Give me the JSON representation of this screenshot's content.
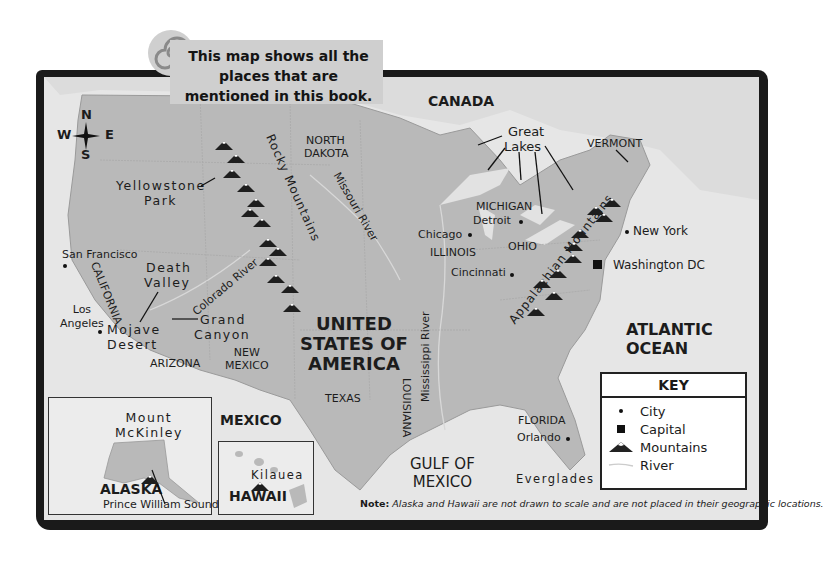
{
  "banner": {
    "text": "This map shows all the places that are mentioned in this book.",
    "icon": "spiral-icon"
  },
  "compass": {
    "n": "N",
    "s": "S",
    "e": "E",
    "w": "W"
  },
  "countries": {
    "canada": "CANADA",
    "mexico": "MEXICO",
    "usa": [
      "UNITED",
      "STATES OF",
      "AMERICA"
    ]
  },
  "water": {
    "atlantic": [
      "ATLANTIC",
      "OCEAN"
    ],
    "gulf": [
      "GULF OF",
      "MEXICO"
    ],
    "great_lakes": [
      "Great",
      "Lakes"
    ],
    "rivers": {
      "missouri": "Missouri River",
      "colorado": "Colorado River",
      "mississippi": "Mississippi River"
    }
  },
  "states": {
    "north_dakota": [
      "NORTH",
      "DAKOTA"
    ],
    "california": "CALIFORNIA",
    "arizona": "ARIZONA",
    "new_mexico": [
      "NEW",
      "MEXICO"
    ],
    "texas": "TEXAS",
    "louisiana": "LOUISIANA",
    "michigan": "MICHIGAN",
    "illinois": "ILLINOIS",
    "ohio": "OHIO",
    "vermont": "VERMONT",
    "florida": "FLORIDA"
  },
  "cities": {
    "san_francisco": "San Francisco",
    "los_angeles": [
      "Los",
      "Angeles"
    ],
    "chicago": "Chicago",
    "detroit": "Detroit",
    "cincinnati": "Cincinnati",
    "new_york": "New York",
    "washington": "Washington DC",
    "orlando": "Orlando"
  },
  "places": {
    "yellowstone": [
      "Yellowstone",
      "Park"
    ],
    "death_valley": [
      "Death",
      "Valley"
    ],
    "mojave": [
      "Mojave",
      "Desert"
    ],
    "grand_canyon": [
      "Grand",
      "Canyon"
    ],
    "everglades": "Everglades",
    "mount_mckinley": [
      "Mount",
      "McKinley"
    ],
    "prince_william": "Prince William Sound",
    "kilauea": "Kilauea"
  },
  "mountains": {
    "rocky": "Rocky Mountains",
    "appalachian": "Appalachian Mountains"
  },
  "insets": {
    "alaska": "ALASKA",
    "hawaii": "HAWAII"
  },
  "key": {
    "title": "KEY",
    "items": [
      {
        "symbol": "city-dot-icon",
        "label": "City"
      },
      {
        "symbol": "capital-square-icon",
        "label": "Capital"
      },
      {
        "symbol": "mountain-icon",
        "label": "Mountains"
      },
      {
        "symbol": "river-line-icon",
        "label": "River"
      }
    ]
  },
  "note": {
    "label": "Note:",
    "text": "Alaska and Hawaii are not drawn to scale and are not placed in their geographic locations."
  },
  "colors": {
    "frame": "#1a1a1a",
    "land": "#b9b9b9",
    "water": "#e6e6e6",
    "banner": "#cfcfcf"
  }
}
